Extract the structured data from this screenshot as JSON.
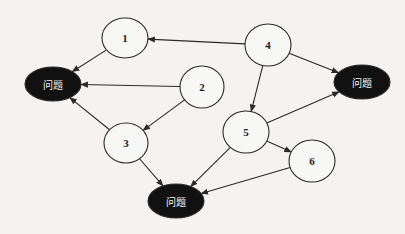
{
  "diagram": {
    "type": "directed-graph",
    "colors": {
      "background": "#f4f3f1",
      "line": "#2a2a2a",
      "white_node_fill": "#f7f7f5",
      "problem_node_fill": "#111111",
      "problem_text": "#f2f2f2"
    },
    "nodes": [
      {
        "id": "n1",
        "label": "1",
        "kind": "circle",
        "cx": 125,
        "cy": 38,
        "rx": 23,
        "ry": 20
      },
      {
        "id": "n2",
        "label": "2",
        "kind": "circle",
        "cx": 202,
        "cy": 87,
        "rx": 22,
        "ry": 21
      },
      {
        "id": "n3",
        "label": "3",
        "kind": "circle",
        "cx": 126,
        "cy": 143,
        "rx": 22,
        "ry": 20
      },
      {
        "id": "n4",
        "label": "4",
        "kind": "circle",
        "cx": 268,
        "cy": 45,
        "rx": 23,
        "ry": 21
      },
      {
        "id": "n5",
        "label": "5",
        "kind": "circle",
        "cx": 246,
        "cy": 132,
        "rx": 23,
        "ry": 21
      },
      {
        "id": "n6",
        "label": "6",
        "kind": "circle",
        "cx": 312,
        "cy": 161,
        "rx": 23,
        "ry": 21
      },
      {
        "id": "pL",
        "label": "问题",
        "kind": "problem",
        "cx": 53,
        "cy": 84,
        "rx": 28,
        "ry": 17
      },
      {
        "id": "pR",
        "label": "问题",
        "kind": "problem",
        "cx": 362,
        "cy": 82,
        "rx": 28,
        "ry": 17
      },
      {
        "id": "pB",
        "label": "问题",
        "kind": "problem",
        "cx": 176,
        "cy": 201,
        "rx": 28,
        "ry": 17
      }
    ],
    "edges": [
      {
        "from": "n4",
        "to": "n1"
      },
      {
        "from": "n1",
        "to": "pL"
      },
      {
        "from": "n2",
        "to": "pL"
      },
      {
        "from": "n3",
        "to": "pL"
      },
      {
        "from": "n2",
        "to": "n3"
      },
      {
        "from": "n4",
        "to": "n5"
      },
      {
        "from": "n4",
        "to": "pR"
      },
      {
        "from": "n5",
        "to": "pR"
      },
      {
        "from": "n5",
        "to": "n6"
      },
      {
        "from": "n5",
        "to": "pB"
      },
      {
        "from": "n3",
        "to": "pB"
      },
      {
        "from": "n6",
        "to": "pB"
      }
    ]
  }
}
